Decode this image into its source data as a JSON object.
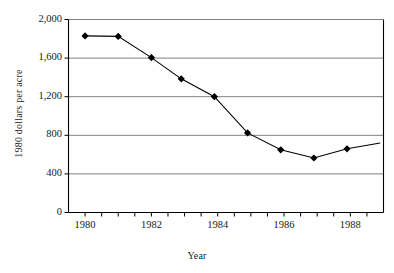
{
  "chart_data": {
    "type": "line",
    "title": "",
    "xlabel": "Year",
    "ylabel": "1980 dollars per acre",
    "xlim": [
      1979.5,
      1989.0
    ],
    "ylim": [
      0,
      2000
    ],
    "grid": true,
    "legend": false,
    "xticks": [
      "1980",
      "1982",
      "1984",
      "1986",
      "1988"
    ],
    "xtick_values": [
      1980,
      1982,
      1984,
      1986,
      1988
    ],
    "yticks": [
      "0",
      "400",
      "800",
      "1,200",
      "1,600",
      "2,000"
    ],
    "ytick_values": [
      0,
      400,
      800,
      1200,
      1600,
      2000
    ],
    "series": [
      {
        "name": "Farmland value",
        "marker": "diamond",
        "color": "#000000",
        "x": [
          1980.0,
          1981.0,
          1982.0,
          1982.9,
          1983.9,
          1984.9,
          1985.9,
          1986.9,
          1987.9,
          1988.9
        ],
        "values": [
          1830,
          1825,
          1605,
          1385,
          1200,
          825,
          650,
          565,
          660,
          720
        ],
        "marker_shown": [
          true,
          true,
          true,
          true,
          true,
          true,
          true,
          true,
          true,
          false
        ]
      }
    ]
  },
  "style": {
    "axis_color": "#000000",
    "grid_color": "#808080",
    "line_color": "#000000",
    "marker_color": "#000000",
    "background": "#ffffff"
  }
}
